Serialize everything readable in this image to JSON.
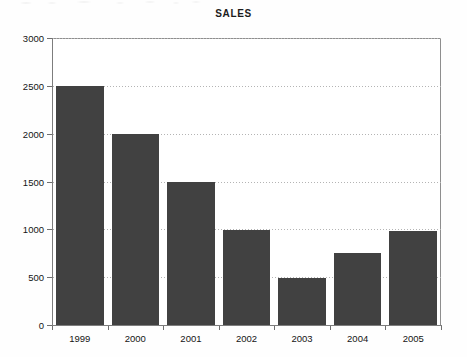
{
  "chart_data": {
    "type": "bar",
    "title": "SALES",
    "xlabel": "",
    "ylabel": "",
    "categories": [
      "1999",
      "2000",
      "2001",
      "2002",
      "2003",
      "2004",
      "2005"
    ],
    "values": [
      2500,
      2000,
      1500,
      990,
      490,
      750,
      980
    ],
    "series": [
      {
        "name": "SALES",
        "values": [
          2500,
          2000,
          1500,
          990,
          490,
          750,
          980
        ]
      }
    ],
    "ylim": [
      0,
      3000
    ],
    "ytick_labels": [
      "0",
      "500",
      "1000",
      "1500",
      "2000",
      "2500",
      "3000"
    ],
    "ytick_values": [
      0,
      500,
      1000,
      1500,
      2000,
      2500,
      3000
    ],
    "grid": "horizontal-dotted",
    "legend": "none",
    "bar_color": "#414141",
    "gridline_color": "#b4b4b4",
    "axis_color": "#7d7d7d",
    "background_color": "#ffffff"
  }
}
